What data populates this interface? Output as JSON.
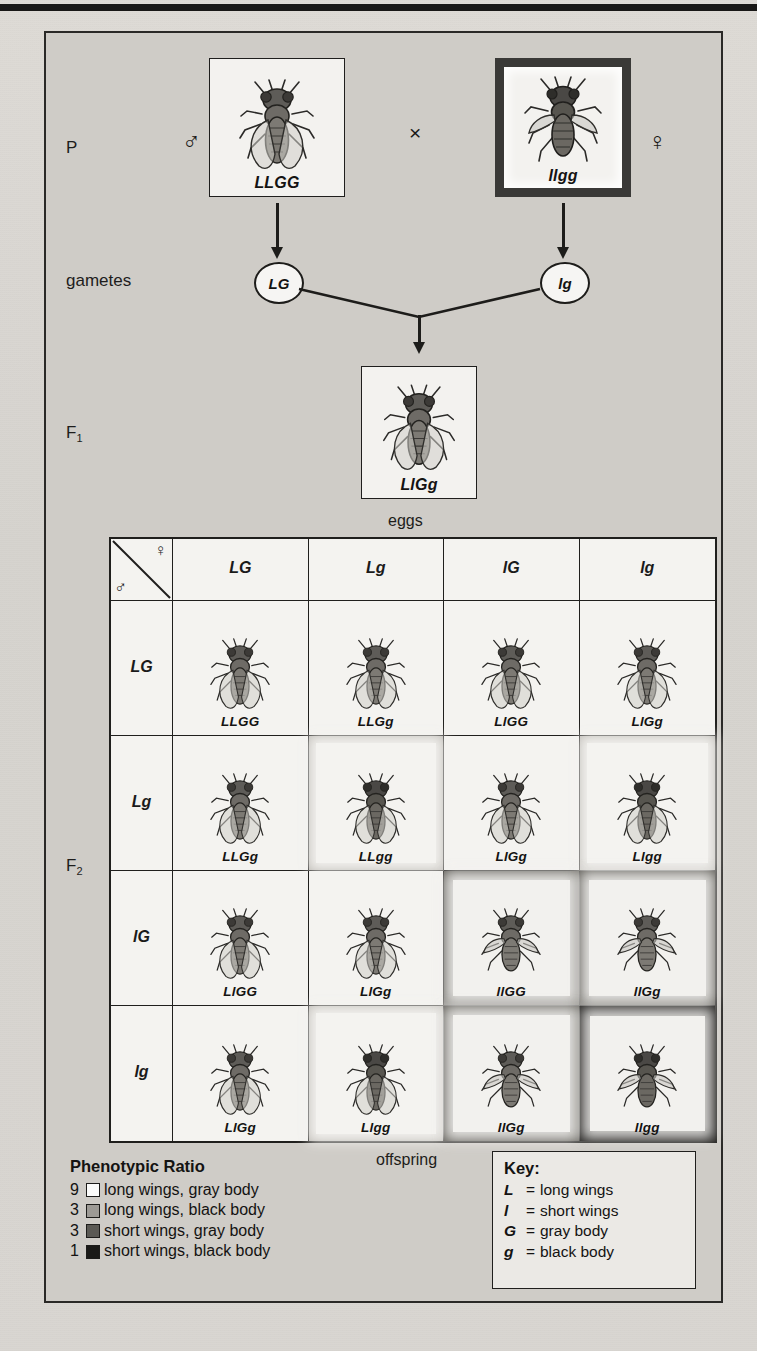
{
  "figure": {
    "generations": {
      "p_label": "P",
      "gametes_label": "gametes",
      "f1_label": "F",
      "f1_sub": "1",
      "f2_label": "F",
      "f2_sub": "2"
    },
    "cross_symbol": "×",
    "male_symbol": "♂",
    "female_symbol": "♀",
    "parents": [
      {
        "name": "male-parent",
        "genotype": "LLGG",
        "sex": "♂",
        "shade": "white",
        "wings": "long",
        "body": "gray"
      },
      {
        "name": "female-parent",
        "genotype": "llgg",
        "sex": "♀",
        "shade": "black",
        "wings": "short",
        "body": "black"
      }
    ],
    "gametes": [
      {
        "name": "male-gamete",
        "label": "LG"
      },
      {
        "name": "female-gamete",
        "label": "lg"
      }
    ],
    "f1": {
      "genotype": "LlGg",
      "wings": "long",
      "body": "gray",
      "shade": "white"
    },
    "axis_labels": {
      "top": "eggs",
      "bottom": "offspring",
      "left": "sperm"
    },
    "punnett": {
      "col_headers": [
        "LG",
        "Lg",
        "lG",
        "lg"
      ],
      "row_headers": [
        "LG",
        "Lg",
        "lG",
        "lg"
      ],
      "cells": [
        [
          {
            "genotype": "LLGG",
            "shade": "white",
            "wings": "long",
            "body": "gray"
          },
          {
            "genotype": "LLGg",
            "shade": "white",
            "wings": "long",
            "body": "gray"
          },
          {
            "genotype": "LlGG",
            "shade": "white",
            "wings": "long",
            "body": "gray"
          },
          {
            "genotype": "LlGg",
            "shade": "white",
            "wings": "long",
            "body": "gray"
          }
        ],
        [
          {
            "genotype": "LLGg",
            "shade": "white",
            "wings": "long",
            "body": "gray"
          },
          {
            "genotype": "LLgg",
            "shade": "gray",
            "wings": "long",
            "body": "black"
          },
          {
            "genotype": "LlGg",
            "shade": "white",
            "wings": "long",
            "body": "gray"
          },
          {
            "genotype": "Llgg",
            "shade": "gray",
            "wings": "long",
            "body": "black"
          }
        ],
        [
          {
            "genotype": "LlGG",
            "shade": "white",
            "wings": "long",
            "body": "gray"
          },
          {
            "genotype": "LlGg",
            "shade": "white",
            "wings": "long",
            "body": "gray"
          },
          {
            "genotype": "llGG",
            "shade": "dark",
            "wings": "short",
            "body": "gray"
          },
          {
            "genotype": "llGg",
            "shade": "dark",
            "wings": "short",
            "body": "gray"
          }
        ],
        [
          {
            "genotype": "LlGg",
            "shade": "white",
            "wings": "long",
            "body": "gray"
          },
          {
            "genotype": "Llgg",
            "shade": "gray",
            "wings": "long",
            "body": "black"
          },
          {
            "genotype": "llGg",
            "shade": "dark",
            "wings": "short",
            "body": "gray"
          },
          {
            "genotype": "llgg",
            "shade": "black",
            "wings": "short",
            "body": "black"
          }
        ]
      ]
    },
    "phenotypic_ratio": {
      "title": "Phenotypic Ratio",
      "rows": [
        {
          "count": "9",
          "swatch": "white",
          "text": "long wings, gray body"
        },
        {
          "count": "3",
          "swatch": "lgray",
          "text": "long wings, black body"
        },
        {
          "count": "3",
          "swatch": "dgray",
          "text": "short wings, gray body"
        },
        {
          "count": "1",
          "swatch": "black",
          "text": "short wings, black body"
        }
      ]
    },
    "key": {
      "title": "Key:",
      "equals": "=",
      "rows": [
        {
          "symbol": "L",
          "meaning": "long wings"
        },
        {
          "symbol": "l",
          "meaning": "short wings"
        },
        {
          "symbol": "G",
          "meaning": "gray body"
        },
        {
          "symbol": "g",
          "meaning": "black body"
        }
      ]
    }
  },
  "colors": {
    "paper": "#d8d6d2",
    "ink": "#1a1a1a",
    "cell_white": "#f4f3f0",
    "shade_light_gray": "#b9b6b1",
    "shade_dark_gray": "#57554f",
    "shade_black": "#232220"
  },
  "chart_data": {
    "type": "table",
    "categories": [
      "long wings, gray body",
      "long wings, black body",
      "short wings, gray body",
      "short wings, black body"
    ],
    "values": [
      9,
      3,
      3,
      1
    ],
    "xlabel": "phenotype",
    "ylabel": "number of offspring out of 16",
    "legend": [
      "9 : 3 : 3 : 1"
    ]
  }
}
